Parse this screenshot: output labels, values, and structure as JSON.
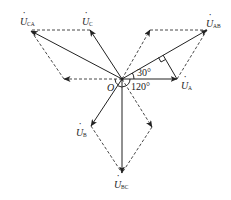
{
  "figure": {
    "type": "phasor-diagram",
    "origin_label": "O",
    "angles": [
      {
        "label": "30°"
      },
      {
        "label": "120°"
      }
    ],
    "phasors": [
      {
        "id": "UA",
        "label": "U",
        "subscript": "A",
        "kind": "phase"
      },
      {
        "id": "UB",
        "label": "U",
        "subscript": "B",
        "kind": "phase"
      },
      {
        "id": "UC",
        "label": "U",
        "subscript": "C",
        "kind": "phase"
      },
      {
        "id": "UAB",
        "label": "U",
        "subscript": "AB",
        "kind": "line"
      },
      {
        "id": "UBC",
        "label": "U",
        "subscript": "BC",
        "kind": "line"
      },
      {
        "id": "UCA",
        "label": "U",
        "subscript": "CA",
        "kind": "line"
      }
    ]
  },
  "labels": {
    "o": "O",
    "a30": "30°",
    "a120": "120°",
    "u": "U",
    "sub_a": "A",
    "sub_b": "B",
    "sub_c": "C",
    "sub_ab": "AB",
    "sub_bc": "BC",
    "sub_ca": "CA",
    "dot": "·"
  },
  "colors": {
    "line": "#222222",
    "background": "#ffffff"
  }
}
